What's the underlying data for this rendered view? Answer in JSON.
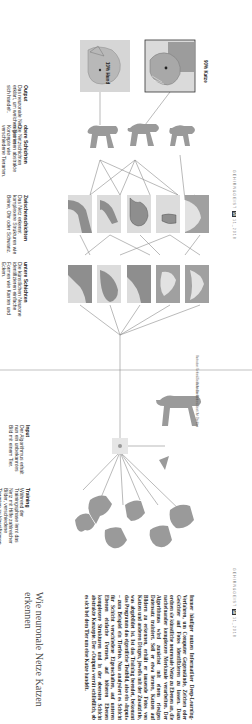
{
  "article": {
    "title": "Wie neuronale Netze Katzen erkennen",
    "body": "Immer häufiger nutzen Informatiker Deep-Learning-Verfahren, um Computer Gegenstände, Zeichen oder Gesichter auf Fotos identifizieren zu lassen. Dazu ordnen sie künstliche neuronale Netze zu Ebenen an, die nacheinander komplexere Merkmale verarbeiten. Der Algorithmus wird zunächst mit einem riesigen Datensatz trainiert. Soll er etwa lernen, Katzen auf Bildern zu erkennen, erhält er tausende Fotos von Katzen und anderen Dingen, jeweils mit der Zusatzinfo, was abgebildet ist. Ist das Training beendet, bekommt das Programm das eigentliche Testbild, also ein »Input« – zum Beispiel ein Tierfoto. Nun analysiert es Schicht für Schicht verschiedene Eigenschaften, auf unteren Ebenen einfache Formen, auf höheren Ebenen komplexere Strukturen und in der obersten Schicht abstrakte Konzepte. Der »Output« verrät schließlich, ob es sich bei dem Tier um eine Katze handelt."
  },
  "stages": {
    "training": {
      "heading": "Training",
      "text": "Während der Trainingsphase lernt das Netz mit Hilfe zahlreicher Bilder, verschiedene Tierarten zu klassifizieren."
    },
    "input": {
      "heading": "Input",
      "text": "Der Algorithmus erhält nun ein unbekanntes Bild mit einem Tier."
    },
    "lower_layers": {
      "heading": "untere Schichten",
      "text": "Die künstlichen Neurone identifizieren einfache Formen wie Kanten und Ecken."
    },
    "middle_layers": {
      "heading": "Zwischenschichten",
      "text": "Das Netz erkennt komplexere Strukturen wie Beine, Ohr oder Schwanz."
    },
    "upper_layers": {
      "heading": "obere Schichten",
      "text": "Die Netzschichten registrieren abstrakte Konzepte wie verschiedene Tierarten."
    },
    "output": {
      "heading": "Output",
      "text": "Das neuronale Netz erklärt, um welches Tier es sich handelt."
    }
  },
  "results": [
    {
      "label": "10% Hund",
      "animal": "dog"
    },
    {
      "label": "90% Katze",
      "animal": "cat",
      "highlighted": true
    }
  ],
  "folios": {
    "left": {
      "magazine": "GEHIRN&GEIST",
      "page": "58",
      "issue": "11_2018"
    },
    "right": {
      "magazine": "GEHIRN&GEIST",
      "page": "59",
      "issue": "11_2018"
    }
  },
  "credits": {
    "top": "Illustration: Gehirn&Geist / Art Direktion",
    "bottom": "Illustration: Gehirn&Geist / Art Direktion"
  }
}
